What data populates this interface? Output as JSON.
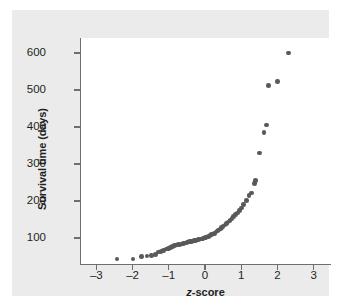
{
  "figure": {
    "background_color": "#ebebeb",
    "panel_color": "#ffffff",
    "axis_color": "#6d6e70",
    "marker_color": "#58595b"
  },
  "axes": {
    "ylabel": "Survival time (days)",
    "xlabel_prefix": "z",
    "xlabel_suffix": "-score",
    "ytick_labels": [
      "600",
      "500",
      "400",
      "300",
      "200",
      "100"
    ],
    "xtick_labels": [
      "–3",
      "–2",
      "–1",
      "0",
      "1",
      "2",
      "3"
    ]
  },
  "chart_data": {
    "type": "scatter",
    "title": "",
    "xlabel": "z-score",
    "ylabel": "Survival time (days)",
    "xlim": [
      -3.45,
      3.45
    ],
    "ylim": [
      30,
      640
    ],
    "xticks": [
      -3,
      -2,
      -1,
      0,
      1,
      2,
      3
    ],
    "yticks": [
      100,
      200,
      300,
      400,
      500,
      600
    ],
    "grid": false,
    "legend": null,
    "marker_size_px": 4.6,
    "series": [
      {
        "name": "Survival time vs z-score (normal quantile plot)",
        "points": [
          [
            -2.43,
            43
          ],
          [
            -1.99,
            44
          ],
          [
            -1.75,
            50
          ],
          [
            -1.6,
            52
          ],
          [
            -1.47,
            53
          ],
          [
            -1.37,
            56
          ],
          [
            -1.29,
            62
          ],
          [
            -1.21,
            64
          ],
          [
            -1.14,
            67
          ],
          [
            -1.07,
            70
          ],
          [
            -1.01,
            72
          ],
          [
            -0.95,
            74
          ],
          [
            -0.89,
            78
          ],
          [
            -0.84,
            80
          ],
          [
            -0.79,
            81
          ],
          [
            -0.74,
            82
          ],
          [
            -0.69,
            83
          ],
          [
            -0.64,
            84
          ],
          [
            -0.59,
            86
          ],
          [
            -0.55,
            87
          ],
          [
            -0.5,
            88
          ],
          [
            -0.46,
            89
          ],
          [
            -0.42,
            90
          ],
          [
            -0.38,
            91
          ],
          [
            -0.34,
            92
          ],
          [
            -0.3,
            93
          ],
          [
            -0.26,
            94
          ],
          [
            -0.22,
            95
          ],
          [
            -0.18,
            96
          ],
          [
            -0.14,
            97
          ],
          [
            -0.1,
            98
          ],
          [
            -0.06,
            99
          ],
          [
            -0.02,
            100
          ],
          [
            0.02,
            101
          ],
          [
            0.06,
            103
          ],
          [
            0.1,
            105
          ],
          [
            0.14,
            107
          ],
          [
            0.18,
            109
          ],
          [
            0.22,
            111
          ],
          [
            0.26,
            113
          ],
          [
            0.3,
            116
          ],
          [
            0.34,
            119
          ],
          [
            0.38,
            122
          ],
          [
            0.42,
            125
          ],
          [
            0.46,
            128
          ],
          [
            0.5,
            131
          ],
          [
            0.55,
            135
          ],
          [
            0.59,
            139
          ],
          [
            0.64,
            143
          ],
          [
            0.69,
            148
          ],
          [
            0.74,
            153
          ],
          [
            0.79,
            158
          ],
          [
            0.84,
            163
          ],
          [
            0.89,
            168
          ],
          [
            0.95,
            174
          ],
          [
            1.01,
            181
          ],
          [
            1.07,
            190
          ],
          [
            1.14,
            201
          ],
          [
            1.21,
            215
          ],
          [
            1.29,
            222
          ],
          [
            1.37,
            248
          ],
          [
            1.4,
            255
          ],
          [
            1.5,
            330
          ],
          [
            1.63,
            385
          ],
          [
            1.7,
            405
          ],
          [
            1.76,
            512
          ],
          [
            2.0,
            522
          ],
          [
            2.3,
            600
          ]
        ]
      }
    ]
  }
}
